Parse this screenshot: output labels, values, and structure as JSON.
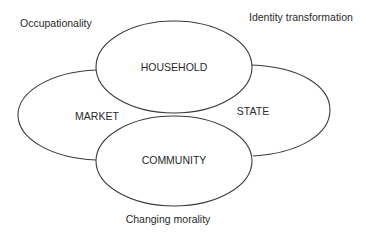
{
  "diagram": {
    "type": "overlapping-ellipses",
    "colors": {
      "stroke": "#3a3a3a",
      "text": "#2a2a2a",
      "background": "#ffffff"
    },
    "domains": {
      "household": "HOUSEHOLD",
      "community": "COMMUNITY",
      "market": "MARKET",
      "state": "STATE"
    },
    "annotations": {
      "top_left": "Occupationality",
      "top_right": "Identity transformation",
      "bottom": "Changing morality"
    }
  }
}
